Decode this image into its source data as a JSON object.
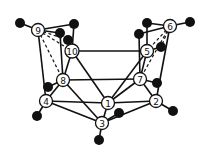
{
  "diagram": {
    "type": "molecular-cluster-graph",
    "nodes": [
      {
        "id": "1",
        "label": "1",
        "x": 108,
        "y": 103
      },
      {
        "id": "2",
        "label": "2",
        "x": 156,
        "y": 101
      },
      {
        "id": "3",
        "label": "3",
        "x": 102,
        "y": 123
      },
      {
        "id": "4",
        "label": "4",
        "x": 46,
        "y": 101
      },
      {
        "id": "5",
        "label": "5",
        "x": 147,
        "y": 51
      },
      {
        "id": "6",
        "label": "6",
        "x": 170,
        "y": 26
      },
      {
        "id": "7",
        "label": "7",
        "x": 140,
        "y": 79
      },
      {
        "id": "8",
        "label": "8",
        "x": 63,
        "y": 80
      },
      {
        "id": "9",
        "label": "9",
        "x": 38,
        "y": 30
      },
      {
        "id": "10",
        "label": "10",
        "x": 72,
        "y": 51
      }
    ],
    "terminal_atoms": [
      {
        "id": "a9l",
        "x": 20,
        "y": 23
      },
      {
        "id": "a9r",
        "x": 74,
        "y": 24
      },
      {
        "id": "a9m",
        "x": 60,
        "y": 33
      },
      {
        "id": "a10",
        "x": 68,
        "y": 40
      },
      {
        "id": "a6r",
        "x": 190,
        "y": 22
      },
      {
        "id": "a6l",
        "x": 147,
        "y": 23
      },
      {
        "id": "a6m",
        "x": 139,
        "y": 34
      },
      {
        "id": "a5",
        "x": 161,
        "y": 47
      },
      {
        "id": "a8",
        "x": 48,
        "y": 87
      },
      {
        "id": "a4",
        "x": 37,
        "y": 116
      },
      {
        "id": "a7",
        "x": 157,
        "y": 83
      },
      {
        "id": "a1",
        "x": 119,
        "y": 113
      },
      {
        "id": "a2",
        "x": 173,
        "y": 111
      },
      {
        "id": "a3",
        "x": 99,
        "y": 140
      }
    ],
    "edges": [
      {
        "from": "9",
        "to": "a9l",
        "style": "solid"
      },
      {
        "from": "9",
        "to": "a9r",
        "style": "solid"
      },
      {
        "from": "9",
        "to": "a9m",
        "style": "solid"
      },
      {
        "from": "9",
        "to": "10",
        "style": "dashed"
      },
      {
        "from": "9",
        "to": "a10",
        "style": "dashed"
      },
      {
        "from": "9",
        "to": "8",
        "style": "dashed"
      },
      {
        "from": "9",
        "to": "4",
        "style": "solid"
      },
      {
        "from": "a9r",
        "to": "10",
        "style": "solid"
      },
      {
        "from": "a9m",
        "to": "8",
        "style": "solid"
      },
      {
        "from": "10",
        "to": "a10",
        "style": "solid"
      },
      {
        "from": "10",
        "to": "5",
        "style": "solid"
      },
      {
        "from": "10",
        "to": "8",
        "style": "solid"
      },
      {
        "from": "10",
        "to": "1",
        "style": "solid"
      },
      {
        "from": "6",
        "to": "a6r",
        "style": "solid"
      },
      {
        "from": "6",
        "to": "a6l",
        "style": "solid"
      },
      {
        "from": "6",
        "to": "a6m",
        "style": "solid"
      },
      {
        "from": "6",
        "to": "5",
        "style": "dashed"
      },
      {
        "from": "6",
        "to": "a5",
        "style": "dashed"
      },
      {
        "from": "6",
        "to": "7",
        "style": "dashed"
      },
      {
        "from": "6",
        "to": "2",
        "style": "solid"
      },
      {
        "from": "a6l",
        "to": "5",
        "style": "solid"
      },
      {
        "from": "a6m",
        "to": "7",
        "style": "solid"
      },
      {
        "from": "5",
        "to": "a5",
        "style": "solid"
      },
      {
        "from": "5",
        "to": "7",
        "style": "solid"
      },
      {
        "from": "5",
        "to": "1",
        "style": "solid"
      },
      {
        "from": "8",
        "to": "7",
        "style": "solid"
      },
      {
        "from": "8",
        "to": "4",
        "style": "solid"
      },
      {
        "from": "8",
        "to": "3",
        "style": "solid"
      },
      {
        "from": "8",
        "to": "a8",
        "style": "solid"
      },
      {
        "from": "7",
        "to": "1",
        "style": "solid"
      },
      {
        "from": "7",
        "to": "2",
        "style": "solid"
      },
      {
        "from": "7",
        "to": "a7",
        "style": "solid"
      },
      {
        "from": "4",
        "to": "1",
        "style": "solid"
      },
      {
        "from": "4",
        "to": "3",
        "style": "solid"
      },
      {
        "from": "4",
        "to": "a4",
        "style": "solid"
      },
      {
        "from": "1",
        "to": "2",
        "style": "solid"
      },
      {
        "from": "1",
        "to": "3",
        "style": "solid"
      },
      {
        "from": "2",
        "to": "3",
        "style": "solid"
      },
      {
        "from": "2",
        "to": "a2",
        "style": "solid"
      },
      {
        "from": "3",
        "to": "a3",
        "style": "solid"
      },
      {
        "from": "3",
        "to": "a1",
        "style": "solid"
      }
    ]
  }
}
